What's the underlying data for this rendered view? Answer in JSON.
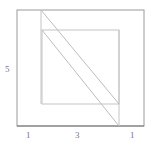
{
  "diagram": {
    "type": "nested squares with diagonal strip",
    "labels": {
      "left_side": "5",
      "bottom_left": "1",
      "bottom_middle": "3",
      "bottom_right": "1"
    },
    "colors": {
      "outer_stroke": "#8c8c8c",
      "inner_stroke": "#bdbdbd",
      "label": "#777777"
    }
  }
}
